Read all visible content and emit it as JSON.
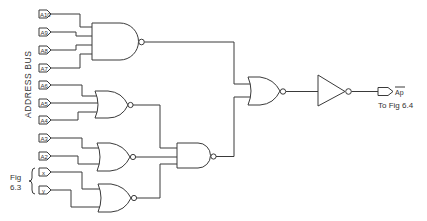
{
  "diagram": {
    "type": "logic-circuit",
    "bus_label": "ADDRESS BUS",
    "inputs": [
      {
        "id": "A10",
        "label": "A10",
        "y": 14
      },
      {
        "id": "A9",
        "label": "A9",
        "y": 32
      },
      {
        "id": "A8",
        "label": "A8",
        "y": 50
      },
      {
        "id": "A7",
        "label": "A7",
        "y": 68
      },
      {
        "id": "A6",
        "label": "A6",
        "y": 85
      },
      {
        "id": "A5",
        "label": "A5",
        "y": 103
      },
      {
        "id": "A4",
        "label": "A4",
        "y": 120
      },
      {
        "id": "A3",
        "label": "A3",
        "y": 138
      },
      {
        "id": "A2",
        "label": "A2",
        "y": 156
      },
      {
        "id": "x",
        "label": "x",
        "y": 172
      },
      {
        "id": "y",
        "label": "y",
        "y": 190
      }
    ],
    "fig_ref_label_line1": "Fig",
    "fig_ref_label_line2": "6.3",
    "gates": [
      {
        "id": "nand4",
        "type": "NAND",
        "inputs": [
          "A10",
          "A9",
          "A8",
          "A7"
        ]
      },
      {
        "id": "nor_a",
        "type": "NOR",
        "inputs": [
          "A6",
          "A5",
          "A4"
        ]
      },
      {
        "id": "nor_b",
        "type": "NOR",
        "inputs": [
          "A3",
          "A2"
        ]
      },
      {
        "id": "nor_c",
        "type": "NOR",
        "inputs": [
          "x",
          "y"
        ]
      },
      {
        "id": "nand3",
        "type": "NAND",
        "inputs": [
          "nor_a",
          "nor_b",
          "nor_c"
        ]
      },
      {
        "id": "nor_out",
        "type": "NOR",
        "inputs": [
          "nand4",
          "nand3"
        ]
      },
      {
        "id": "inv",
        "type": "NOT",
        "inputs": [
          "nor_out"
        ]
      }
    ],
    "output": {
      "label": "Ap",
      "overbar": true,
      "destination": "To Fig 6.4"
    }
  }
}
